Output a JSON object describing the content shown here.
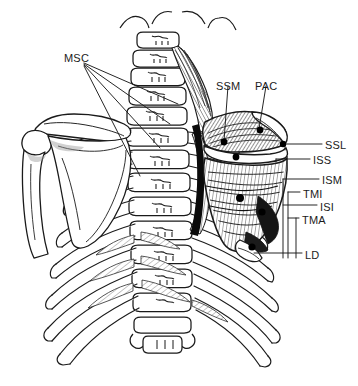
{
  "figure": {
    "kind": "anatomical-illustration",
    "view": "posterior",
    "background_color": "#ffffff",
    "ink_color": "#1a1a1a",
    "shading_color": "#6f6f6f",
    "marker_color": "#000000"
  },
  "labels": [
    {
      "id": "msc",
      "text": "MSC",
      "name": "multifidi-semispinalis-cervicis",
      "x": 64,
      "y": 53,
      "align": "left"
    },
    {
      "id": "ssm",
      "text": "SSM",
      "name": "supraspinatus-medial",
      "x": 216,
      "y": 81,
      "align": "left"
    },
    {
      "id": "pac",
      "text": "PAC",
      "name": "posterior-acromial",
      "x": 255,
      "y": 81,
      "align": "left"
    },
    {
      "id": "ssl",
      "text": "SSL",
      "name": "supraspinatus-lateral",
      "x": 325,
      "y": 140,
      "align": "left"
    },
    {
      "id": "iss",
      "text": "ISS",
      "name": "infraspinatus-superior",
      "x": 313,
      "y": 155,
      "align": "left"
    },
    {
      "id": "ism",
      "text": "ISM",
      "name": "infraspinatus-medial",
      "x": 322,
      "y": 175,
      "align": "left"
    },
    {
      "id": "tmi",
      "text": "TMI",
      "name": "teres-minor",
      "x": 303,
      "y": 189,
      "align": "left"
    },
    {
      "id": "isi",
      "text": "ISI",
      "name": "infraspinatus-inferior",
      "x": 320,
      "y": 202,
      "align": "left"
    },
    {
      "id": "tma",
      "text": "TMA",
      "name": "teres-major",
      "x": 302,
      "y": 215,
      "align": "left"
    },
    {
      "id": "ld",
      "text": "LD",
      "name": "latissimus-dorsi",
      "x": 305,
      "y": 250,
      "align": "left"
    }
  ],
  "leader_lines": {
    "msc": [
      {
        "x1": 84,
        "y1": 63,
        "x2": 178,
        "y2": 104
      },
      {
        "x1": 84,
        "y1": 64,
        "x2": 170,
        "y2": 124
      },
      {
        "x1": 84,
        "y1": 65,
        "x2": 160,
        "y2": 148
      },
      {
        "x1": 84,
        "y1": 66,
        "x2": 140,
        "y2": 176
      }
    ],
    "ssm": [
      {
        "x1": 228,
        "y1": 86,
        "x2": 224,
        "y2": 141
      }
    ],
    "pac": [
      {
        "x1": 266,
        "y1": 86,
        "x2": 259,
        "y2": 129
      }
    ],
    "ssl": [
      {
        "x1": 322,
        "y1": 144,
        "x2": 285,
        "y2": 144
      }
    ],
    "iss": [
      {
        "x1": 310,
        "y1": 159,
        "x2": 276,
        "y2": 159
      }
    ],
    "ism": [
      {
        "x1": 319,
        "y1": 179,
        "x2": 283,
        "y2": 179
      }
    ],
    "tmi": [
      {
        "x1": 300,
        "y1": 192,
        "x2": 288,
        "y2": 192
      }
    ],
    "isi": [
      {
        "x1": 317,
        "y1": 205,
        "x2": 283,
        "y2": 205
      }
    ],
    "tma": [
      {
        "x1": 299,
        "y1": 218,
        "x2": 288,
        "y2": 218
      }
    ],
    "ld": [
      {
        "x1": 302,
        "y1": 253,
        "x2": 254,
        "y2": 253
      }
    ]
  },
  "vertical_risers": [
    {
      "name": "ssl-riser",
      "x": 285,
      "y1": 144,
      "y2": 150
    },
    {
      "name": "iss-riser",
      "x": 276,
      "y1": 159,
      "y2": 162
    },
    {
      "name": "tmi-riser",
      "x": 288,
      "y1": 192,
      "y2": 258
    },
    {
      "name": "tma-riser",
      "x": 296,
      "y1": 218,
      "y2": 258
    },
    {
      "name": "ism-riser",
      "x": 283,
      "y1": 179,
      "y2": 258
    }
  ],
  "trigger_points": [
    {
      "name": "ssm-point",
      "cx": 224,
      "cy": 142,
      "r": 3.4
    },
    {
      "name": "pac-point",
      "cx": 260,
      "cy": 130,
      "r": 3.4
    },
    {
      "name": "ssl-point",
      "cx": 283,
      "cy": 144,
      "r": 3.2
    },
    {
      "name": "iss-point",
      "cx": 236,
      "cy": 157,
      "r": 3.4
    },
    {
      "name": "isi-point",
      "cx": 240,
      "cy": 198,
      "r": 4.0
    },
    {
      "name": "tma-point",
      "cx": 262,
      "cy": 212,
      "r": 3.6
    },
    {
      "name": "ld-point",
      "cx": 252,
      "cy": 247,
      "r": 3.6
    }
  ],
  "anatomy_parts": [
    {
      "name": "cervical-spine",
      "label": "Cervical vertebrae C1-C7"
    },
    {
      "name": "thoracic-spine",
      "label": "Thoracic vertebrae T1-T12"
    },
    {
      "name": "sacrum-lumbar",
      "label": "Lower thoracic / lumbar junction"
    },
    {
      "name": "left-scapula",
      "label": "Left scapula"
    },
    {
      "name": "left-clavicle",
      "label": "Left clavicle"
    },
    {
      "name": "left-humerus",
      "label": "Left humerus"
    },
    {
      "name": "right-scapula-muscles",
      "label": "Right scapula with rotator cuff musculature"
    },
    {
      "name": "rib-cage",
      "label": "Posterior rib cage"
    },
    {
      "name": "levator-costae",
      "label": "Levator costarum muscles"
    },
    {
      "name": "rhomboid-fan",
      "label": "Rhomboid / levator scapulae fibres"
    },
    {
      "name": "medial-border-shadow",
      "label": "Medial scapular border shadow"
    }
  ]
}
